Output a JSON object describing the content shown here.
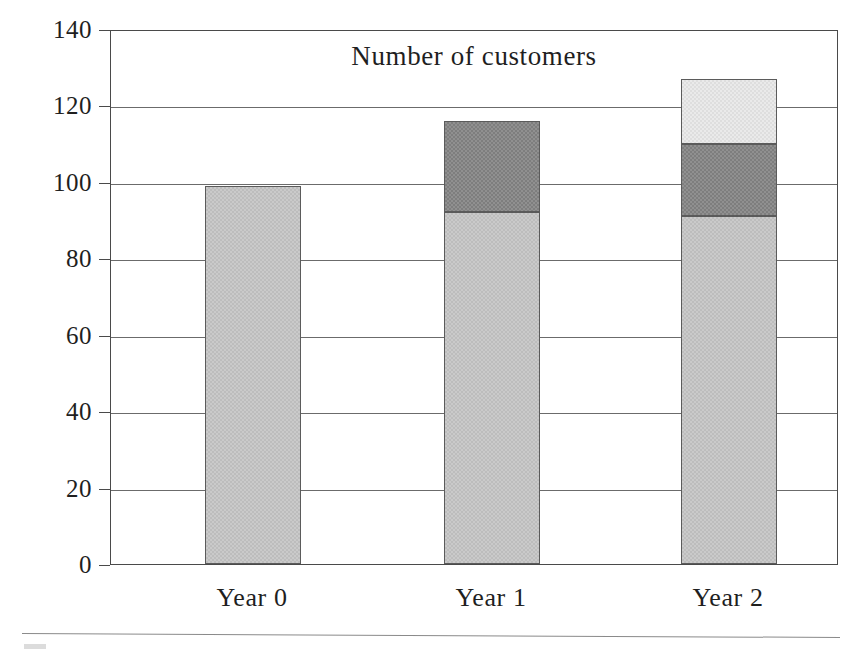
{
  "chart_data": {
    "type": "bar",
    "subtype": "stacked-column",
    "title": "Number of customers",
    "xlabel": "",
    "ylabel": "",
    "categories": [
      "Year 0",
      "Year 1",
      "Year 2"
    ],
    "ylim": [
      0,
      140
    ],
    "y_ticks": [
      0,
      20,
      40,
      60,
      80,
      100,
      120,
      140
    ],
    "y_tick_labels": [
      "0",
      "20",
      "40",
      "60",
      "80",
      "100",
      "120",
      "140"
    ],
    "grid": "horizontal",
    "legend": "none",
    "series": [
      {
        "name": "Existing customers",
        "fill": "light-gray",
        "color": "#cacaca",
        "values": [
          99,
          92,
          91
        ]
      },
      {
        "name": "New customers year 1",
        "fill": "dark-gray",
        "color": "#909090",
        "values": [
          0,
          24,
          19
        ]
      },
      {
        "name": "New customers year 2",
        "fill": "pale-gray",
        "color": "#eaeaea",
        "values": [
          0,
          0,
          17
        ]
      }
    ],
    "totals": [
      99,
      116,
      127
    ]
  },
  "figure": {
    "background": "#ffffff",
    "frame_color": "#4a4a4a",
    "gridline_color": "#6b6b6b",
    "text_color": "#1f1f1f"
  }
}
